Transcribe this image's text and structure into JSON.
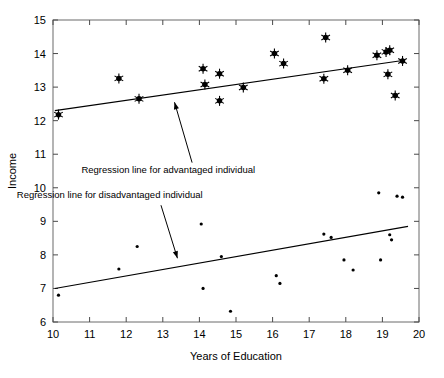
{
  "chart_data": {
    "type": "scatter",
    "title": "",
    "xlabel": "Years of Education",
    "ylabel": "Income",
    "xlim": [
      10,
      20
    ],
    "ylim": [
      6,
      15
    ],
    "xticks": [
      10,
      11,
      12,
      13,
      14,
      15,
      16,
      17,
      18,
      19,
      20
    ],
    "xtick_labels": [
      "10",
      "11",
      "12",
      "13",
      "14",
      "15",
      "16",
      "17",
      "18",
      "19",
      "20"
    ],
    "yticks": [
      6,
      7,
      8,
      9,
      10,
      11,
      12,
      13,
      14,
      15
    ],
    "ytick_labels": [
      "6",
      "7",
      "8",
      "9",
      "10",
      "11",
      "12",
      "13",
      "14",
      "15"
    ],
    "grid": false,
    "legend": "none",
    "series": [
      {
        "name": "advantaged individual",
        "marker": "asterisk-dot",
        "marker_size": 5.0,
        "color": "#000000",
        "points": [
          [
            10.15,
            12.18
          ],
          [
            11.8,
            13.26
          ],
          [
            12.35,
            12.65
          ],
          [
            14.1,
            13.55
          ],
          [
            14.15,
            13.08
          ],
          [
            14.55,
            13.4
          ],
          [
            14.55,
            12.59
          ],
          [
            15.2,
            12.99
          ],
          [
            16.05,
            14.0
          ],
          [
            16.3,
            13.7
          ],
          [
            17.4,
            13.25
          ],
          [
            17.45,
            14.48
          ],
          [
            18.05,
            13.5
          ],
          [
            18.85,
            13.95
          ],
          [
            19.1,
            14.05
          ],
          [
            19.2,
            14.1
          ],
          [
            19.15,
            13.38
          ],
          [
            19.35,
            12.75
          ],
          [
            19.55,
            13.78
          ]
        ]
      },
      {
        "name": "disadvantaged individual",
        "marker": "dot",
        "marker_size": 1.6,
        "color": "#000000",
        "points": [
          [
            10.15,
            6.8
          ],
          [
            11.8,
            7.58
          ],
          [
            12.3,
            8.25
          ],
          [
            14.05,
            8.92
          ],
          [
            14.1,
            7.0
          ],
          [
            14.6,
            7.95
          ],
          [
            14.85,
            6.32
          ],
          [
            16.1,
            7.38
          ],
          [
            16.2,
            7.15
          ],
          [
            17.4,
            8.62
          ],
          [
            17.6,
            8.52
          ],
          [
            17.95,
            7.85
          ],
          [
            18.2,
            7.55
          ],
          [
            18.9,
            9.85
          ],
          [
            18.95,
            7.85
          ],
          [
            19.2,
            8.6
          ],
          [
            19.25,
            8.45
          ],
          [
            19.4,
            9.75
          ],
          [
            19.55,
            9.72
          ]
        ]
      }
    ],
    "regression_lines": [
      {
        "name": "advantaged",
        "x": [
          10.05,
          19.6
        ],
        "y": [
          12.3,
          13.8
        ]
      },
      {
        "name": "disadvantaged",
        "x": [
          10.05,
          19.7
        ],
        "y": [
          7.0,
          8.85
        ]
      }
    ],
    "annotations": [
      {
        "id": "advantaged",
        "text": "Regression line for advantaged individual",
        "text_x": 13.15,
        "text_y": 10.45,
        "arrow_from_x": 13.8,
        "arrow_from_y": 10.75,
        "arrow_to_x": 13.32,
        "arrow_to_y": 12.55
      },
      {
        "id": "disadvantaged",
        "text": "Regression line for disadvantaged individual",
        "text_x": 11.55,
        "text_y": 9.7,
        "arrow_from_x": 12.95,
        "arrow_from_y": 9.48,
        "arrow_to_x": 13.4,
        "arrow_to_y": 7.9
      }
    ]
  }
}
